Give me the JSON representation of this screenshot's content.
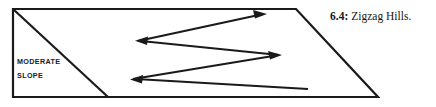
{
  "figure": {
    "caption": {
      "number": "6.4:",
      "title": "Zigzag Hills."
    },
    "labels": {
      "slope_line1": "MODERATE",
      "slope_line2": "SLOPE"
    },
    "colors": {
      "stroke": "#1a1a1a",
      "background": "#ffffff",
      "text": "#161616"
    },
    "geometry": {
      "parallelogram": "13,9 296,9 378,97 13,97",
      "slope_diagonal": "13,9 108,97",
      "zigzag_path": "308,89 132,79 280,55 137,41 265,14",
      "stroke_width": 1.8,
      "arrow_vertices": [
        {
          "name": "path-start-tail",
          "x": 308,
          "y": 89,
          "arrow": false
        },
        {
          "name": "arrowhead-left-lower",
          "x": 132,
          "y": 79,
          "arrow": true
        },
        {
          "name": "arrowhead-right-middle",
          "x": 280,
          "y": 55,
          "arrow": true
        },
        {
          "name": "arrowhead-left-upper",
          "x": 137,
          "y": 41,
          "arrow": true
        },
        {
          "name": "arrowhead-right-top",
          "x": 265,
          "y": 14,
          "arrow": true
        }
      ]
    }
  }
}
